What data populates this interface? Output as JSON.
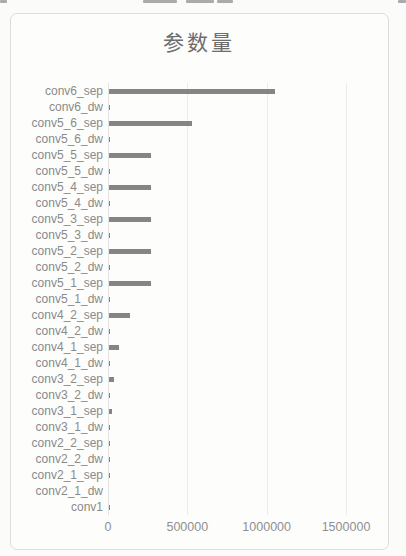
{
  "chart_data": {
    "type": "bar",
    "orientation": "horizontal",
    "title": "参数量",
    "categories": [
      "conv6_sep",
      "conv6_dw",
      "conv5_6_sep",
      "conv5_6_dw",
      "conv5_5_sep",
      "conv5_5_dw",
      "conv5_4_sep",
      "conv5_4_dw",
      "conv5_3_sep",
      "conv5_3_dw",
      "conv5_2_sep",
      "conv5_2_dw",
      "conv5_1_sep",
      "conv5_1_dw",
      "conv4_2_sep",
      "conv4_2_dw",
      "conv4_1_sep",
      "conv4_1_dw",
      "conv3_2_sep",
      "conv3_2_dw",
      "conv3_1_sep",
      "conv3_1_dw",
      "conv2_2_sep",
      "conv2_2_dw",
      "conv2_1_sep",
      "conv2_1_dw",
      "conv1"
    ],
    "values": [
      1048576,
      9216,
      524288,
      4608,
      262144,
      4608,
      262144,
      4608,
      262144,
      4608,
      262144,
      4608,
      262144,
      4608,
      131072,
      2304,
      65536,
      2304,
      32768,
      1152,
      16384,
      1152,
      8192,
      576,
      2048,
      288,
      864
    ],
    "xlabel": "",
    "ylabel": "",
    "xlim": [
      0,
      1700000
    ],
    "x_ticks": [
      0,
      500000,
      1000000,
      1500000
    ],
    "x_tick_labels": [
      "0",
      "500000",
      "1000000",
      "1500000"
    ],
    "grid": true,
    "legend": "none",
    "bar_color": "#858585",
    "title_color": "#6d6d6d",
    "axis_label_color": "#8a8a8a",
    "gridline_color": "#ececec"
  }
}
